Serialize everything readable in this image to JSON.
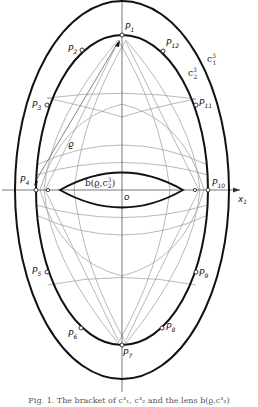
{
  "figure": {
    "axis_x_label": "x",
    "axis_x_sub": "1",
    "origin_label": "o",
    "rho_label": "ϱ",
    "curve_outer_label": "c",
    "curve_outer_sup": "3",
    "curve_outer_sub": "1",
    "curve_inner_label": "c",
    "curve_inner_sup": "3",
    "curve_inner_sub": "2",
    "lens_label": "b(ϱ,c",
    "lens_label_sup": "3",
    "lens_label_sub": "2",
    "lens_label_close": ")",
    "points": [
      {
        "name": "P",
        "sub": "1"
      },
      {
        "name": "P",
        "sub": "2"
      },
      {
        "name": "P",
        "sub": "3"
      },
      {
        "name": "P",
        "sub": "4"
      },
      {
        "name": "P",
        "sub": "5"
      },
      {
        "name": "P",
        "sub": "6"
      },
      {
        "name": "P",
        "sub": "7"
      },
      {
        "name": "P",
        "sub": "8"
      },
      {
        "name": "P",
        "sub": "9"
      },
      {
        "name": "P",
        "sub": "10"
      },
      {
        "name": "P",
        "sub": "11"
      },
      {
        "name": "P",
        "sub": "12"
      }
    ],
    "caption": "Fig. 1. The bracket of c³₁, c³₂ and the lens b(ϱ,c³₂)"
  },
  "colors": {
    "curve": "#111111",
    "construction": "#9a9a9a",
    "axis": "#555555"
  }
}
